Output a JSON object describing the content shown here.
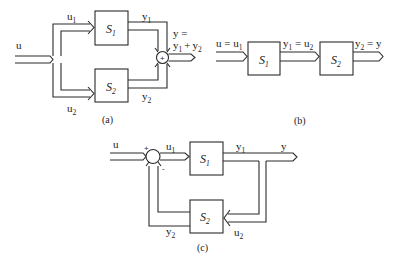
{
  "diagram_a": {
    "caption": "(a)",
    "title": "Parallel connection",
    "input": "u",
    "branch_top_label": "u",
    "branch_top_sub": "1",
    "branch_bottom_label": "u",
    "branch_bottom_sub": "2",
    "block1": {
      "name": "S",
      "sub": "1"
    },
    "block2": {
      "name": "S",
      "sub": "2"
    },
    "out1_label": "y",
    "out1_sub": "1",
    "out2_label": "y",
    "out2_sub": "2",
    "sum_symbol": "+",
    "output_line1": "y =",
    "output_y1": "y",
    "output_y1_sub": "1",
    "output_plus": "+",
    "output_y2": "y",
    "output_y2_sub": "2"
  },
  "diagram_b": {
    "caption": "(b)",
    "title": "Series connection",
    "input_label": "u = u",
    "input_sub": "1",
    "block1": {
      "name": "S",
      "sub": "1"
    },
    "block2": {
      "name": "S",
      "sub": "2"
    },
    "mid_y": "y",
    "mid_y_sub": "1",
    "mid_eq": " = u",
    "mid_u_sub": "2",
    "out_y": "y",
    "out_y_sub": "2",
    "out_eq": " = y"
  },
  "diagram_c": {
    "caption": "(c)",
    "title": "Feedback connection",
    "input": "u",
    "plus_sign": "+",
    "minus_sign": "-",
    "u1_label": "u",
    "u1_sub": "1",
    "block1": {
      "name": "S",
      "sub": "1"
    },
    "block2": {
      "name": "S",
      "sub": "2"
    },
    "y1_label": "y",
    "y1_sub": "1",
    "output": "y",
    "u2_label": "u",
    "u2_sub": "2",
    "y2_label": "y",
    "y2_sub": "2"
  }
}
